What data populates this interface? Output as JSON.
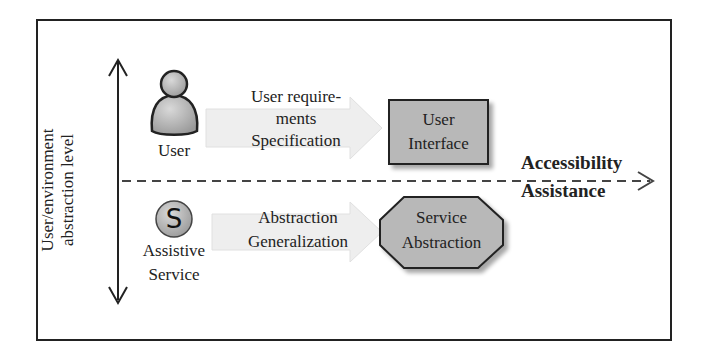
{
  "diagram": {
    "axis_label": {
      "line1": "User/environment",
      "line2": "abstraction level"
    },
    "user": {
      "icon": "user-person-icon",
      "label": "User"
    },
    "assistive_service": {
      "icon": "service-s-icon",
      "icon_letter": "S",
      "label_line1": "Assistive",
      "label_line2": "Service"
    },
    "upper_arrow": {
      "line1": "User require-",
      "line2": "ments",
      "line3": "Specification"
    },
    "lower_arrow": {
      "line1": "Abstraction",
      "line2": "Generalization"
    },
    "user_interface": {
      "line1": "User",
      "line2": "Interface"
    },
    "service_abstraction": {
      "line1": "Service",
      "line2": "Abstraction"
    },
    "divider": {
      "label_top": "Accessibility",
      "label_bottom": "Assistance"
    },
    "colors": {
      "frame": "#222222",
      "box_fill": "#b8b8b8",
      "icon_fill": "#b0b0b0",
      "faded_arrow": "#e6e6e6"
    }
  }
}
